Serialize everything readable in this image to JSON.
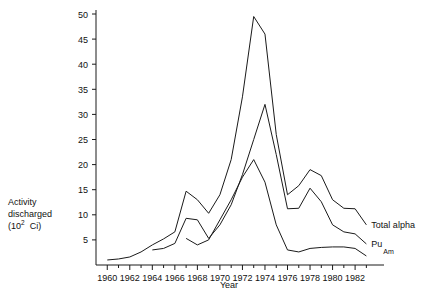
{
  "chart_data": {
    "type": "line",
    "title": "",
    "xlabel": "Year",
    "ylabel": "Activity discharged (10^2 Ci)",
    "ylabel_lines": [
      "Activity",
      "discharged",
      "(10",
      "2",
      "Ci)"
    ],
    "xlim": [
      1959,
      1983.5
    ],
    "ylim": [
      0,
      50
    ],
    "ytick_values": [
      5,
      10,
      15,
      20,
      25,
      30,
      35,
      40,
      45,
      50
    ],
    "ytick_labels": [
      "5",
      "10",
      "15",
      "20",
      "25",
      "30",
      "35",
      "40",
      "45",
      "50"
    ],
    "xtick_values": [
      1960,
      1962,
      1964,
      1966,
      1968,
      1970,
      1972,
      1974,
      1976,
      1978,
      1980,
      1982
    ],
    "xtick_labels": [
      "1960",
      "1962",
      "1964",
      "1966",
      "1968",
      "1970",
      "1972",
      "1974",
      "1976",
      "1978",
      "1980",
      "1982"
    ],
    "xminor_values": [
      1961,
      1963,
      1965,
      1967,
      1969,
      1971,
      1973,
      1975,
      1977,
      1979,
      1981,
      1983
    ],
    "grid": false,
    "legend_position": "right-inline",
    "series": [
      {
        "name": "Total alpha",
        "label": "Total alpha",
        "x": [
          1960,
          1961,
          1962,
          1963,
          1964,
          1965,
          1966,
          1967,
          1968,
          1969,
          1970,
          1971,
          1972,
          1973,
          1974,
          1975,
          1976,
          1977,
          1978,
          1979,
          1980,
          1981,
          1982,
          1983
        ],
        "y": [
          1.0,
          1.2,
          1.6,
          2.6,
          4.0,
          5.2,
          6.6,
          14.7,
          13.0,
          10.3,
          14.0,
          21.0,
          33.5,
          49.5,
          46.0,
          26.0,
          14.0,
          15.8,
          19.0,
          17.8,
          13.0,
          11.3,
          11.2,
          8.0
        ]
      },
      {
        "name": "Pu",
        "label": "Pu",
        "x": [
          1964,
          1965,
          1966,
          1967,
          1968,
          1969,
          1970,
          1971,
          1972,
          1973,
          1974,
          1975,
          1976,
          1977,
          1978,
          1979,
          1980,
          1981,
          1982,
          1983
        ],
        "y": [
          3.0,
          3.3,
          4.3,
          9.3,
          9.0,
          5.3,
          8.0,
          12.0,
          18.0,
          25.0,
          32.0,
          22.0,
          11.2,
          11.3,
          15.3,
          12.6,
          8.0,
          6.6,
          6.2,
          4.2
        ]
      },
      {
        "name": "Am",
        "label": "Am",
        "x": [
          1967,
          1968,
          1969,
          1970,
          1971,
          1972,
          1973,
          1974,
          1975,
          1976,
          1977,
          1978,
          1979,
          1980,
          1981,
          1982,
          1983
        ],
        "y": [
          5.3,
          4.0,
          5.0,
          9.0,
          13.0,
          17.5,
          21.0,
          16.5,
          8.0,
          3.0,
          2.6,
          3.3,
          3.5,
          3.6,
          3.6,
          3.3,
          1.8
        ]
      }
    ]
  },
  "axis": {
    "ylabel_line1": "Activity",
    "ylabel_line2": "discharged",
    "ylabel_prefix": "(10",
    "ylabel_exponent": "2",
    "ylabel_suffix": "Ci)",
    "xlabel": "Year"
  },
  "colors": {
    "line": "#1a1a1a",
    "background": "#ffffff",
    "text": "#111111"
  }
}
